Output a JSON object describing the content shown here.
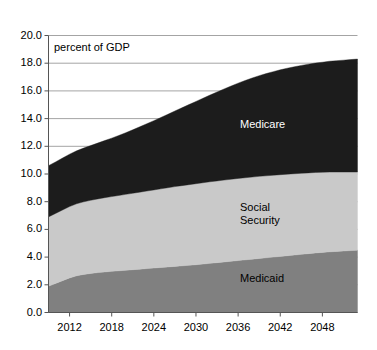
{
  "chart_data": {
    "type": "area",
    "stacked": true,
    "title": "",
    "subtitle": "",
    "annotation": "percent of GDP",
    "xlabel": "",
    "ylabel": "",
    "xlim": [
      2009,
      2053
    ],
    "ylim": [
      0.0,
      20.0
    ],
    "grid": true,
    "grid_axis": "y",
    "legend_position": "inline-labels",
    "x": [
      2009,
      2010,
      2011,
      2012,
      2013,
      2014,
      2015,
      2016,
      2017,
      2018,
      2019,
      2020,
      2021,
      2022,
      2023,
      2024,
      2025,
      2026,
      2027,
      2028,
      2029,
      2030,
      2031,
      2032,
      2033,
      2034,
      2035,
      2036,
      2037,
      2038,
      2039,
      2040,
      2041,
      2042,
      2043,
      2044,
      2045,
      2046,
      2047,
      2048,
      2049,
      2050,
      2051,
      2052,
      2053
    ],
    "xticks": [
      2012,
      2018,
      2024,
      2030,
      2036,
      2042,
      2048
    ],
    "xtick_labels": [
      "2012",
      "2018",
      "2024",
      "2030",
      "2036",
      "2042",
      "2048"
    ],
    "yticks": [
      0.0,
      2.0,
      4.0,
      6.0,
      8.0,
      10.0,
      12.0,
      14.0,
      16.0,
      18.0,
      20.0
    ],
    "ytick_labels": [
      "0.0",
      "2.0",
      "4.0",
      "6.0",
      "8.0",
      "10.0",
      "12.0",
      "14.0",
      "16.0",
      "18.0",
      "20.0"
    ],
    "series": [
      {
        "name": "Medicaid",
        "color": "#808080",
        "label_color": "#000000",
        "order": 1,
        "values": [
          1.9,
          2.1,
          2.3,
          2.5,
          2.65,
          2.75,
          2.82,
          2.88,
          2.93,
          2.97,
          3.01,
          3.05,
          3.09,
          3.13,
          3.17,
          3.21,
          3.25,
          3.29,
          3.33,
          3.37,
          3.41,
          3.45,
          3.5,
          3.55,
          3.6,
          3.65,
          3.7,
          3.75,
          3.8,
          3.85,
          3.9,
          3.95,
          4.0,
          4.05,
          4.1,
          4.15,
          4.2,
          4.25,
          4.3,
          4.34,
          4.38,
          4.41,
          4.44,
          4.47,
          4.5
        ]
      },
      {
        "name": "Social Security",
        "color": "#c9c9c9",
        "label_color": "#000000",
        "order": 2,
        "values": [
          5.0,
          5.05,
          5.1,
          5.15,
          5.2,
          5.24,
          5.28,
          5.32,
          5.36,
          5.4,
          5.44,
          5.48,
          5.52,
          5.56,
          5.6,
          5.64,
          5.68,
          5.72,
          5.76,
          5.79,
          5.82,
          5.85,
          5.87,
          5.89,
          5.9,
          5.91,
          5.92,
          5.93,
          5.93,
          5.93,
          5.93,
          5.92,
          5.91,
          5.9,
          5.89,
          5.87,
          5.85,
          5.83,
          5.81,
          5.78,
          5.76,
          5.73,
          5.7,
          5.67,
          5.64
        ]
      },
      {
        "name": "Medicare",
        "color": "#1c1c1c",
        "label_color": "#ffffff",
        "order": 3,
        "values": [
          3.7,
          3.72,
          3.75,
          3.78,
          3.82,
          3.88,
          3.95,
          4.03,
          4.12,
          4.22,
          4.33,
          4.45,
          4.58,
          4.72,
          4.86,
          5.0,
          5.15,
          5.3,
          5.46,
          5.62,
          5.78,
          5.94,
          6.1,
          6.26,
          6.42,
          6.58,
          6.73,
          6.88,
          7.02,
          7.15,
          7.27,
          7.38,
          7.48,
          7.57,
          7.65,
          7.72,
          7.79,
          7.85,
          7.9,
          7.95,
          8.0,
          8.04,
          8.08,
          8.12,
          8.16
        ]
      }
    ],
    "cumulative_tops": {
      "medicaid_start": 1.9,
      "medicaid_end": 4.5,
      "social_security_top_start": 6.9,
      "social_security_top_end": 10.14,
      "total_start": 10.6,
      "total_end": 18.3
    }
  },
  "labels": {
    "medicare": "Medicare",
    "social_security_line1": "Social",
    "social_security_line2": "Security",
    "medicaid": "Medicaid",
    "annotation": "percent of GDP"
  },
  "colors": {
    "medicare": "#1c1c1c",
    "social_security": "#c9c9c9",
    "medicaid": "#808080",
    "grid": "#9a9a9a",
    "axis": "#555555",
    "background": "#ffffff"
  }
}
